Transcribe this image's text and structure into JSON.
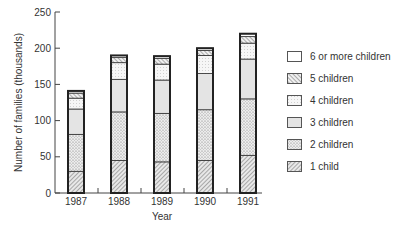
{
  "chart_data": {
    "type": "bar",
    "stacked": true,
    "title": "",
    "xlabel": "Year",
    "ylabel": "Number of families (thousands)",
    "ylim": [
      0,
      250
    ],
    "yticks": [
      0,
      50,
      100,
      150,
      200,
      250
    ],
    "categories": [
      "1987",
      "1988",
      "1989",
      "1990",
      "1991"
    ],
    "series": [
      {
        "name": "1 child",
        "pattern": "hatch-dense",
        "values": [
          30,
          45,
          43,
          45,
          52
        ]
      },
      {
        "name": "2 children",
        "pattern": "dots",
        "values": [
          51,
          67,
          67,
          70,
          78
        ]
      },
      {
        "name": "3 children",
        "pattern": "light-grey",
        "values": [
          35,
          45,
          46,
          50,
          55
        ]
      },
      {
        "name": "4 children",
        "pattern": "fine-grid",
        "values": [
          15,
          23,
          22,
          25,
          22
        ]
      },
      {
        "name": "5 children",
        "pattern": "hatch-wide",
        "values": [
          7,
          7,
          8,
          7,
          9
        ]
      },
      {
        "name": "6 or more children",
        "pattern": "white",
        "values": [
          3,
          3,
          3,
          3,
          4
        ]
      }
    ],
    "totals": [
      141,
      190,
      189,
      200,
      220
    ],
    "legend_position": "right",
    "grid": false
  },
  "legend": {
    "items": [
      {
        "label": "6 or more children",
        "pattern": "white"
      },
      {
        "label": "5 children",
        "pattern": "hatch-wide"
      },
      {
        "label": "4 children",
        "pattern": "fine-grid"
      },
      {
        "label": "3 children",
        "pattern": "light-grey"
      },
      {
        "label": "2 children",
        "pattern": "dots"
      },
      {
        "label": "1 child",
        "pattern": "hatch-dense"
      }
    ]
  }
}
